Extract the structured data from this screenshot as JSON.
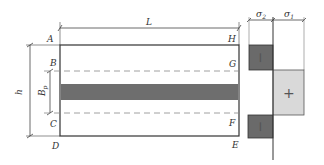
{
  "diagram": {
    "labels": {
      "L": "L",
      "h": "h",
      "Bp_main": "B",
      "Bp_sub": "p",
      "A": "A",
      "B": "B",
      "C": "C",
      "D": "D",
      "E": "E",
      "F": "F",
      "G": "G",
      "H": "H",
      "sigma2_main": "σ",
      "sigma2_sub": "2",
      "sigma1_main": "σ",
      "sigma1_sub": "1",
      "sign_top": "−",
      "sign_mid": "+",
      "sign_bottom": "−"
    },
    "colors": {
      "outline": "#333333",
      "dashed": "#888888",
      "band": "#6e6e6e",
      "dark_block": "#6a6a6a",
      "light_block": "#d9d9d9"
    }
  }
}
